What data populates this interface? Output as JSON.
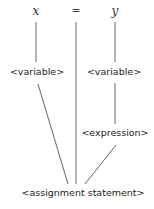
{
  "diagram": {
    "tokens": {
      "x": "x",
      "equals": "=",
      "y": "y"
    },
    "nodes": {
      "variable_left": "<variable>",
      "variable_right": "<variable>",
      "expression": "<expression>",
      "assignment_statement": "<assignment statement>"
    },
    "line_color": "#444444",
    "edges": [
      [
        "x",
        "variable_left"
      ],
      [
        "y",
        "variable_right"
      ],
      [
        "variable_right",
        "expression"
      ],
      [
        "variable_left",
        "assignment_statement"
      ],
      [
        "equals",
        "assignment_statement"
      ],
      [
        "expression",
        "assignment_statement"
      ]
    ]
  }
}
